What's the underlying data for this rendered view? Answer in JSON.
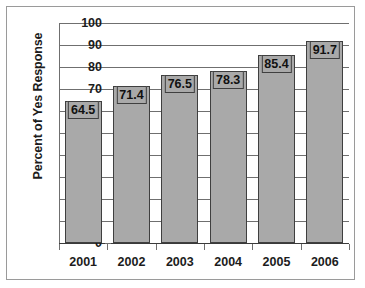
{
  "chart_data": {
    "type": "bar",
    "title": "",
    "xlabel": "",
    "ylabel": "Percent of Yes Response",
    "categories": [
      "2001",
      "2002",
      "2003",
      "2004",
      "2005",
      "2006"
    ],
    "values": [
      64.5,
      71.4,
      76.5,
      78.3,
      85.4,
      91.7
    ],
    "value_labels": [
      "64.5",
      "71.4",
      "76.5",
      "78.3",
      "85.4",
      "91.7"
    ],
    "ylim": [
      0,
      100
    ],
    "ytick_labels": [
      "0",
      "10",
      "20",
      "30",
      "40",
      "50",
      "60",
      "70",
      "80",
      "90",
      "100"
    ],
    "ytick_values": [
      0,
      10,
      20,
      30,
      40,
      50,
      60,
      70,
      80,
      90,
      100
    ],
    "grid": "horizontal",
    "legend": "none",
    "series": [
      {
        "name": "Percent of Yes Response",
        "values": [
          64.5,
          71.4,
          76.5,
          78.3,
          85.4,
          91.7
        ]
      }
    ]
  },
  "style": {
    "bar_fill": "#a9a9a9",
    "bar_border": "#3f3f3f",
    "grid_color": "#6f6f6f",
    "text_color": "#1c1c1c",
    "frame_border": "#9a9a9a",
    "background": "#ffffff"
  }
}
